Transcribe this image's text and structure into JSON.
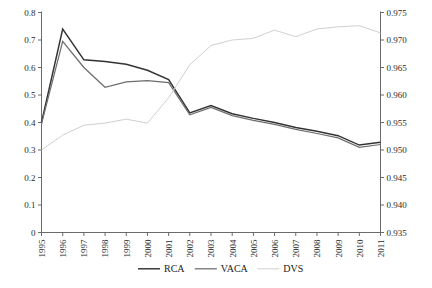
{
  "chart_data": {
    "type": "line",
    "title": "",
    "xlabel": "",
    "ylabel": "",
    "grid": false,
    "legend_position": "bottom",
    "categories": [
      "1995",
      "1996",
      "1997",
      "1998",
      "1999",
      "2000",
      "2001",
      "2002",
      "2003",
      "2004",
      "2005",
      "2006",
      "2007",
      "2008",
      "2009",
      "2010",
      "2011"
    ],
    "left_axis": {
      "ylim": [
        0,
        0.8
      ],
      "ticks": [
        "0",
        "0.1",
        "0.2",
        "0.3",
        "0.4",
        "0.5",
        "0.6",
        "0.7",
        "0.8"
      ],
      "tick_values": [
        0,
        0.1,
        0.2,
        0.3,
        0.4,
        0.5,
        0.6,
        0.7,
        0.8
      ]
    },
    "right_axis": {
      "ylim": [
        0.935,
        0.975
      ],
      "ticks": [
        "0.935",
        "0.940",
        "0.945",
        "0.950",
        "0.955",
        "0.960",
        "0.965",
        "0.970",
        "0.975"
      ],
      "tick_values": [
        0.935,
        0.94,
        0.945,
        0.95,
        0.955,
        0.96,
        0.965,
        0.97,
        0.975
      ]
    },
    "series": [
      {
        "name": "RCA",
        "axis": "left",
        "color": "#333333",
        "values": [
          0.4,
          0.74,
          0.628,
          0.622,
          0.612,
          0.59,
          0.556,
          0.435,
          0.462,
          0.432,
          0.415,
          0.4,
          0.382,
          0.368,
          0.352,
          0.318,
          0.328
        ]
      },
      {
        "name": "VACA",
        "axis": "left",
        "color": "#6e6e6e",
        "values": [
          0.395,
          0.695,
          0.6,
          0.528,
          0.548,
          0.552,
          0.545,
          0.428,
          0.455,
          0.425,
          0.408,
          0.393,
          0.375,
          0.36,
          0.344,
          0.31,
          0.32
        ]
      },
      {
        "name": "DVS",
        "axis": "right",
        "color": "#d0d0d0",
        "values": [
          0.95,
          0.9527,
          0.9545,
          0.9549,
          0.9556,
          0.9549,
          0.9595,
          0.9655,
          0.969,
          0.97,
          0.9703,
          0.9718,
          0.9706,
          0.972,
          0.9724,
          0.9726,
          0.9713
        ]
      }
    ],
    "legend": [
      {
        "label": "RCA",
        "color": "#333333"
      },
      {
        "label": "VACA",
        "color": "#6e6e6e"
      },
      {
        "label": "DVS",
        "color": "#d0d0d0"
      }
    ]
  }
}
